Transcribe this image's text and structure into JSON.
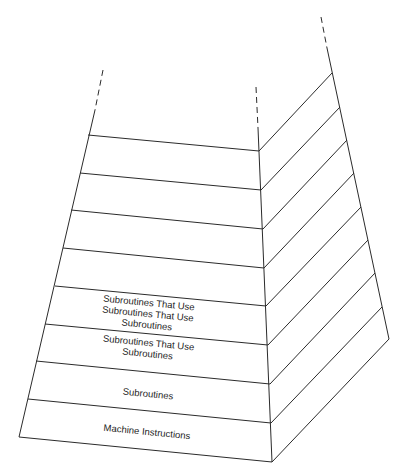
{
  "diagram": {
    "title": "",
    "type": "layered-pyramid",
    "layers_bottom_to_top": [
      {
        "id": "layer-1",
        "lines": [
          "Machine Instructions"
        ]
      },
      {
        "id": "layer-2",
        "lines": [
          "Subroutines"
        ]
      },
      {
        "id": "layer-3",
        "lines": [
          "Subroutines That Use",
          "Subroutines"
        ]
      },
      {
        "id": "layer-4",
        "lines": [
          "Subroutines That Use",
          "Subroutines That Use",
          "Subroutines"
        ]
      },
      {
        "id": "layer-5",
        "lines": []
      },
      {
        "id": "layer-6",
        "lines": []
      },
      {
        "id": "layer-7",
        "lines": []
      },
      {
        "id": "layer-8",
        "lines": []
      }
    ],
    "continues_upward": true,
    "line_color": "#2b2b2b",
    "background_color": "#ffffff"
  }
}
